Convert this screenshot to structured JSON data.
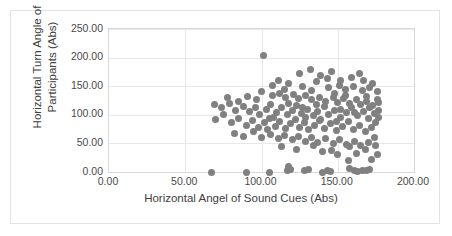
{
  "chart_data": {
    "type": "scatter",
    "title": "",
    "xlabel": "Horizontal Angel of Sound Cues (Abs)",
    "ylabel": "Horizontal Turn Angle of Participants (Abs)",
    "xlim": [
      0,
      200
    ],
    "ylim": [
      0,
      250
    ],
    "xticks": [
      "0.00",
      "50.00",
      "100.00",
      "150.00",
      "200.00"
    ],
    "xtick_values": [
      0,
      50,
      100,
      150,
      200
    ],
    "yticks": [
      "0.00",
      "50.00",
      "100.00",
      "150.00",
      "200.00",
      "250.00"
    ],
    "ytick_values": [
      0,
      50,
      100,
      150,
      200,
      250
    ],
    "grid": true,
    "legend": "none",
    "marker_color": "#808080",
    "marker_size": 7,
    "series": [
      {
        "name": "Participants",
        "points": [
          [
            67,
            0
          ],
          [
            90,
            0
          ],
          [
            105,
            0
          ],
          [
            117,
            2
          ],
          [
            118,
            10
          ],
          [
            119,
            5
          ],
          [
            128,
            2
          ],
          [
            131,
            4
          ],
          [
            140,
            0
          ],
          [
            143,
            3
          ],
          [
            145,
            1
          ],
          [
            158,
            6
          ],
          [
            161,
            2
          ],
          [
            163,
            1
          ],
          [
            166,
            3
          ],
          [
            169,
            2
          ],
          [
            171,
            4
          ],
          [
            157,
            20
          ],
          [
            172,
            22
          ],
          [
            150,
            30
          ],
          [
            140,
            35
          ],
          [
            162,
            33
          ],
          [
            176,
            30
          ],
          [
            101,
            203
          ],
          [
            125,
            172
          ],
          [
            132,
            180
          ],
          [
            139,
            168
          ],
          [
            146,
            175
          ],
          [
            152,
            160
          ],
          [
            118,
            155
          ],
          [
            127,
            150
          ],
          [
            136,
            158
          ],
          [
            144,
            148
          ],
          [
            151,
            152
          ],
          [
            155,
            145
          ],
          [
            160,
            150
          ],
          [
            166,
            142
          ],
          [
            171,
            148
          ],
          [
            176,
            140
          ],
          [
            100,
            140
          ],
          [
            107,
            133
          ],
          [
            112,
            138
          ],
          [
            116,
            130
          ],
          [
            121,
            136
          ],
          [
            124,
            128
          ],
          [
            129,
            134
          ],
          [
            133,
            126
          ],
          [
            138,
            131
          ],
          [
            142,
            124
          ],
          [
            147,
            130
          ],
          [
            150,
            122
          ],
          [
            154,
            128
          ],
          [
            158,
            120
          ],
          [
            162,
            126
          ],
          [
            165,
            118
          ],
          [
            169,
            124
          ],
          [
            173,
            116
          ],
          [
            177,
            121
          ],
          [
            69,
            118
          ],
          [
            74,
            112
          ],
          [
            79,
            120
          ],
          [
            83,
            108
          ],
          [
            88,
            115
          ],
          [
            92,
            105
          ],
          [
            96,
            113
          ],
          [
            99,
            100
          ],
          [
            103,
            110
          ],
          [
            106,
            118
          ],
          [
            110,
            104
          ],
          [
            113,
            112
          ],
          [
            117,
            100
          ],
          [
            120,
            108
          ],
          [
            123,
            116
          ],
          [
            126,
            102
          ],
          [
            130,
            110
          ],
          [
            134,
            98
          ],
          [
            137,
            106
          ],
          [
            141,
            114
          ],
          [
            144,
            100
          ],
          [
            148,
            108
          ],
          [
            152,
            96
          ],
          [
            156,
            104
          ],
          [
            159,
            112
          ],
          [
            163,
            98
          ],
          [
            167,
            106
          ],
          [
            170,
            94
          ],
          [
            174,
            102
          ],
          [
            177,
            108
          ],
          [
            70,
            92
          ],
          [
            75,
            100
          ],
          [
            80,
            86
          ],
          [
            85,
            94
          ],
          [
            90,
            82
          ],
          [
            94,
            90
          ],
          [
            98,
            78
          ],
          [
            102,
            86
          ],
          [
            105,
            94
          ],
          [
            109,
            80
          ],
          [
            112,
            88
          ],
          [
            116,
            76
          ],
          [
            119,
            84
          ],
          [
            122,
            92
          ],
          [
            125,
            78
          ],
          [
            128,
            86
          ],
          [
            131,
            74
          ],
          [
            135,
            82
          ],
          [
            138,
            90
          ],
          [
            141,
            76
          ],
          [
            145,
            84
          ],
          [
            149,
            72
          ],
          [
            153,
            80
          ],
          [
            157,
            88
          ],
          [
            160,
            74
          ],
          [
            164,
            82
          ],
          [
            168,
            70
          ],
          [
            172,
            78
          ],
          [
            175,
            86
          ],
          [
            82,
            68
          ],
          [
            88,
            62
          ],
          [
            95,
            70
          ],
          [
            100,
            60
          ],
          [
            106,
            66
          ],
          [
            111,
            58
          ],
          [
            115,
            64
          ],
          [
            120,
            56
          ],
          [
            124,
            62
          ],
          [
            129,
            54
          ],
          [
            133,
            60
          ],
          [
            137,
            52
          ],
          [
            142,
            58
          ],
          [
            147,
            50
          ],
          [
            151,
            56
          ],
          [
            156,
            48
          ],
          [
            161,
            54
          ],
          [
            165,
            46
          ],
          [
            170,
            52
          ],
          [
            174,
            60
          ],
          [
            113,
            44
          ],
          [
            123,
            40
          ],
          [
            134,
            46
          ],
          [
            146,
            38
          ],
          [
            158,
            44
          ],
          [
            168,
            40
          ],
          [
            175,
            46
          ],
          [
            107,
            152
          ],
          [
            111,
            160
          ],
          [
            115,
            145
          ],
          [
            133,
            142
          ],
          [
            148,
            138
          ],
          [
            155,
            134
          ],
          [
            167,
            160
          ],
          [
            173,
            155
          ],
          [
            78,
            130
          ],
          [
            85,
            124
          ],
          [
            91,
            132
          ],
          [
            97,
            126
          ],
          [
            143,
            164
          ],
          [
            136,
            118
          ],
          [
            159,
            166
          ],
          [
            164,
            172
          ],
          [
            129,
            96
          ],
          [
            139,
            92
          ],
          [
            149,
            88
          ],
          [
            169,
            132
          ],
          [
            176,
            126
          ],
          [
            104,
            74
          ],
          [
            108,
            96
          ],
          [
            118,
            120
          ],
          [
            127,
            112
          ],
          [
            152,
            110
          ],
          [
            161,
            104
          ],
          [
            171,
            112
          ],
          [
            177,
            96
          ]
        ]
      }
    ]
  }
}
